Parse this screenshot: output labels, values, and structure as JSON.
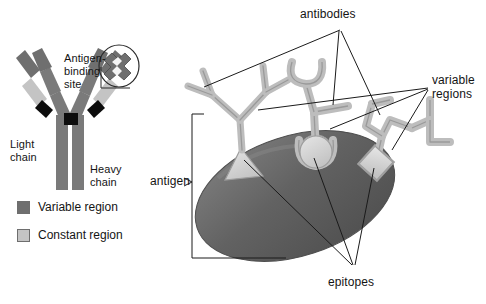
{
  "figure": {
    "background": "#ffffff"
  },
  "left_panel": {
    "name": "antibody-structure-diagram",
    "labels": {
      "antigen_binding_site": "Antigen-\nbinding\nsite",
      "antigen_binding_site_line1": "Antigen-",
      "antigen_binding_site_line2": "binding",
      "antigen_binding_site_line3": "site",
      "light_chain_line1": "Light",
      "light_chain_line2": "chain",
      "heavy_chain_line1": "Heavy",
      "heavy_chain_line2": "chain"
    },
    "legend": {
      "items": [
        {
          "label": "Variable region",
          "color": "#6f6f6f",
          "swatch_name": "variable-region-swatch"
        },
        {
          "label": "Constant region",
          "color": "#c4c4c4",
          "swatch_name": "constant-region-swatch"
        }
      ]
    }
  },
  "right_panel": {
    "name": "antibody-antigen-binding-diagram",
    "labels": {
      "antibodies": "antibodies",
      "variable_line1": "variable",
      "variable_line2": "regions",
      "antigen": "antigen",
      "epitopes": "epitopes"
    },
    "antibody_count": 3,
    "epitopes": [
      {
        "shape": "triangle",
        "name": "epitope-triangle"
      },
      {
        "shape": "circle",
        "name": "epitope-circle"
      },
      {
        "shape": "diamond",
        "name": "epitope-diamond"
      }
    ]
  },
  "colors": {
    "variable_region": "#6f6f6f",
    "constant_region": "#c4c4c4",
    "heavy_chain": "#7a7a7a",
    "hinge": "#0d0d0d",
    "antibody_outline": "#9a9a9a",
    "antibody_fill": "#bdbdbd",
    "antigen_dark": "#5e5e5e",
    "antigen_mid": "#727272",
    "epitope_light": "#d8d8d8",
    "leader_line": "#1a1a1a",
    "text": "#141414"
  }
}
